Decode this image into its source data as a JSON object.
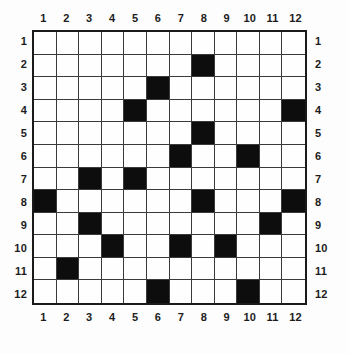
{
  "puzzle": {
    "type": "grid-pattern",
    "rows": 12,
    "columns": 12,
    "fill_color": "#0d0d0d",
    "empty_color": "#ffffff",
    "border_color": "#1a1a1a",
    "gridline_color": "#3a3a3a",
    "column_labels_top": [
      "1",
      "2",
      "3",
      "4",
      "5",
      "6",
      "7",
      "8",
      "9",
      "10",
      "11",
      "12"
    ],
    "column_labels_bottom": [
      "1",
      "2",
      "3",
      "4",
      "5",
      "6",
      "7",
      "8",
      "9",
      "10",
      "11",
      "12"
    ],
    "row_labels_left": [
      "1",
      "2",
      "3",
      "4",
      "5",
      "6",
      "7",
      "8",
      "9",
      "10",
      "11",
      "12"
    ],
    "row_labels_right": [
      "1",
      "2",
      "3",
      "4",
      "5",
      "6",
      "7",
      "8",
      "9",
      "10",
      "11",
      "12"
    ],
    "filled_cells_by_row": {
      "1": [],
      "2": [
        8
      ],
      "3": [
        6
      ],
      "4": [
        5,
        12
      ],
      "5": [
        8
      ],
      "6": [
        7,
        10
      ],
      "7": [
        3,
        5
      ],
      "8": [
        1,
        8,
        12
      ],
      "9": [
        3,
        11
      ],
      "10": [
        4,
        7,
        9
      ],
      "11": [
        2
      ],
      "12": [
        6,
        10
      ]
    },
    "matrix": [
      [
        0,
        0,
        0,
        0,
        0,
        0,
        0,
        0,
        0,
        0,
        0,
        0
      ],
      [
        0,
        0,
        0,
        0,
        0,
        0,
        0,
        1,
        0,
        0,
        0,
        0
      ],
      [
        0,
        0,
        0,
        0,
        0,
        1,
        0,
        0,
        0,
        0,
        0,
        0
      ],
      [
        0,
        0,
        0,
        0,
        1,
        0,
        0,
        0,
        0,
        0,
        0,
        1
      ],
      [
        0,
        0,
        0,
        0,
        0,
        0,
        0,
        1,
        0,
        0,
        0,
        0
      ],
      [
        0,
        0,
        0,
        0,
        0,
        0,
        1,
        0,
        0,
        1,
        0,
        0
      ],
      [
        0,
        0,
        1,
        0,
        1,
        0,
        0,
        0,
        0,
        0,
        0,
        0
      ],
      [
        1,
        0,
        0,
        0,
        0,
        0,
        0,
        1,
        0,
        0,
        0,
        1
      ],
      [
        0,
        0,
        1,
        0,
        0,
        0,
        0,
        0,
        0,
        0,
        1,
        0
      ],
      [
        0,
        0,
        0,
        1,
        0,
        0,
        1,
        0,
        1,
        0,
        0,
        0
      ],
      [
        0,
        1,
        0,
        0,
        0,
        0,
        0,
        0,
        0,
        0,
        0,
        0
      ],
      [
        0,
        0,
        0,
        0,
        0,
        1,
        0,
        0,
        0,
        1,
        0,
        0
      ]
    ],
    "filled_count": 18
  },
  "chart_data": {
    "type": "heatmap",
    "title": "",
    "xlabel": "",
    "ylabel": "",
    "x": [
      "1",
      "2",
      "3",
      "4",
      "5",
      "6",
      "7",
      "8",
      "9",
      "10",
      "11",
      "12"
    ],
    "y": [
      "1",
      "2",
      "3",
      "4",
      "5",
      "6",
      "7",
      "8",
      "9",
      "10",
      "11",
      "12"
    ],
    "values": [
      [
        0,
        0,
        0,
        0,
        0,
        0,
        0,
        0,
        0,
        0,
        0,
        0
      ],
      [
        0,
        0,
        0,
        0,
        0,
        0,
        0,
        1,
        0,
        0,
        0,
        0
      ],
      [
        0,
        0,
        0,
        0,
        0,
        1,
        0,
        0,
        0,
        0,
        0,
        0
      ],
      [
        0,
        0,
        0,
        0,
        1,
        0,
        0,
        0,
        0,
        0,
        0,
        1
      ],
      [
        0,
        0,
        0,
        0,
        0,
        0,
        0,
        1,
        0,
        0,
        0,
        0
      ],
      [
        0,
        0,
        0,
        0,
        0,
        0,
        1,
        0,
        0,
        1,
        0,
        0
      ],
      [
        0,
        0,
        1,
        0,
        1,
        0,
        0,
        0,
        0,
        0,
        0,
        0
      ],
      [
        1,
        0,
        0,
        0,
        0,
        0,
        0,
        1,
        0,
        0,
        0,
        1
      ],
      [
        0,
        0,
        1,
        0,
        0,
        0,
        0,
        0,
        0,
        0,
        1,
        0
      ],
      [
        0,
        0,
        0,
        1,
        0,
        0,
        1,
        0,
        1,
        0,
        0,
        0
      ],
      [
        0,
        1,
        0,
        0,
        0,
        0,
        0,
        0,
        0,
        0,
        0,
        0
      ],
      [
        0,
        0,
        0,
        0,
        0,
        1,
        0,
        0,
        0,
        1,
        0,
        0
      ]
    ],
    "colorscale": [
      "#ffffff",
      "#0d0d0d"
    ],
    "grid": true,
    "legend": "none",
    "axis_ticks_top": [
      "1",
      "2",
      "3",
      "4",
      "5",
      "6",
      "7",
      "8",
      "9",
      "10",
      "11",
      "12"
    ],
    "axis_ticks_bottom": [
      "1",
      "2",
      "3",
      "4",
      "5",
      "6",
      "7",
      "8",
      "9",
      "10",
      "11",
      "12"
    ],
    "axis_ticks_left": [
      "1",
      "2",
      "3",
      "4",
      "5",
      "6",
      "7",
      "8",
      "9",
      "10",
      "11",
      "12"
    ],
    "axis_ticks_right": [
      "1",
      "2",
      "3",
      "4",
      "5",
      "6",
      "7",
      "8",
      "9",
      "10",
      "11",
      "12"
    ]
  }
}
